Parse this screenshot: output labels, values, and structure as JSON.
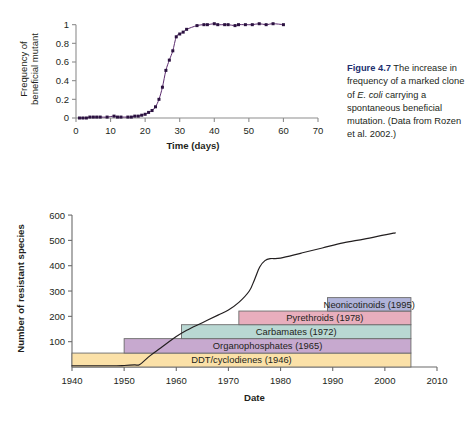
{
  "figure_caption": {
    "number": "Figure 4.7",
    "text_1": " The increase in frequency of a marked clone of ",
    "species": "E. coli",
    "text_2": " carrying a spontaneous beneficial mutation. (Data from Rozen et al. 2002.)"
  },
  "chart_data": [
    {
      "id": "top",
      "type": "line",
      "title": "",
      "xlabel": "Time (days)",
      "ylabel": "Frequency of beneficial mutant",
      "xlim": [
        0,
        70
      ],
      "ylim": [
        0,
        1.05
      ],
      "xticks": [
        0,
        10,
        20,
        30,
        40,
        50,
        60,
        70
      ],
      "xticklabels": [
        "0",
        "10",
        "20",
        "30",
        "40",
        "50",
        "60",
        "70"
      ],
      "yticks": [
        0,
        0.2,
        0.4,
        0.6,
        0.8,
        1
      ],
      "yticklabels": [
        "0",
        "0.2",
        "0.4",
        "0.6",
        "0.8",
        "1"
      ],
      "grid": false,
      "legend": "none",
      "marker": "filled-square",
      "color": "#5b2a6e",
      "series": [
        {
          "name": "Frequency of beneficial mutant",
          "x": [
            1,
            2,
            3,
            4,
            5,
            6,
            7,
            9,
            11,
            12,
            13,
            15,
            16,
            17,
            18,
            19,
            20,
            21,
            22,
            23,
            24,
            25,
            26,
            27,
            28,
            29,
            30,
            31,
            32,
            35,
            37,
            38,
            40,
            41,
            43,
            44,
            46,
            47,
            49,
            51,
            53,
            55,
            57,
            60
          ],
          "y": [
            0.0,
            0.0,
            0.0,
            0.01,
            0.01,
            0.01,
            0.01,
            0.01,
            0.02,
            0.01,
            0.01,
            0.01,
            0.01,
            0.02,
            0.02,
            0.03,
            0.04,
            0.06,
            0.08,
            0.12,
            0.2,
            0.33,
            0.51,
            0.62,
            0.72,
            0.87,
            0.9,
            0.92,
            0.95,
            0.99,
            1.0,
            1.0,
            1.01,
            1.0,
            1.0,
            1.0,
            0.99,
            1.0,
            1.0,
            1.0,
            1.01,
            1.0,
            1.01,
            1.0
          ]
        }
      ]
    },
    {
      "id": "bottom",
      "type": "line",
      "title": "",
      "xlabel": "Date",
      "ylabel": "Number of resistant species",
      "xlim": [
        1940,
        2010
      ],
      "ylim": [
        0,
        620
      ],
      "xticks": [
        1940,
        1950,
        1960,
        1970,
        1980,
        1990,
        2000,
        2010
      ],
      "xticklabels": [
        "1940",
        "1950",
        "1960",
        "1970",
        "1980",
        "1990",
        "2000",
        "2010"
      ],
      "yticks": [
        100,
        200,
        300,
        400,
        500,
        600
      ],
      "yticklabels": [
        "100",
        "200",
        "300",
        "400",
        "500",
        "600"
      ],
      "grid": false,
      "legend": "none",
      "color": "#231f20",
      "series": [
        {
          "name": "Number of resistant species",
          "x": [
            1940,
            1948,
            1950,
            1952,
            1953,
            1955,
            1957,
            1960,
            1962,
            1965,
            1968,
            1970,
            1972,
            1974,
            1975,
            1976,
            1977,
            1978,
            1980,
            1984,
            1988,
            1992,
            1996,
            2000,
            2002
          ],
          "y": [
            5,
            5,
            6,
            8,
            10,
            45,
            75,
            120,
            145,
            175,
            205,
            225,
            255,
            300,
            345,
            395,
            420,
            428,
            430,
            450,
            470,
            490,
            505,
            522,
            530
          ]
        }
      ],
      "bands": [
        {
          "label": "DDT/cyclodienes (1946)",
          "start": 1940,
          "end": 2005,
          "y0": 0,
          "y1": 55,
          "fill": "#fbe1a8",
          "stroke": "#6b6b6b",
          "label_align": "center"
        },
        {
          "label": "Organophosphates (1965)",
          "start": 1950,
          "end": 2005,
          "y0": 55,
          "y1": 112,
          "fill": "#c7a9cf",
          "stroke": "#6b6b6b",
          "label_align": "center"
        },
        {
          "label": "Carbamates (1972)",
          "start": 1961,
          "end": 2005,
          "y0": 112,
          "y1": 167,
          "fill": "#b9d8d3",
          "stroke": "#6b6b6b",
          "label_align": "center"
        },
        {
          "label": "Pyrethroids (1978)",
          "start": 1972,
          "end": 2005,
          "y0": 167,
          "y1": 221,
          "fill": "#e8aebd",
          "stroke": "#6b6b6b",
          "label_align": "center"
        },
        {
          "label": "Neonicotinoids (1995)",
          "start": 1989,
          "end": 2005,
          "y0": 221,
          "y1": 274,
          "fill": "#b0b3d9",
          "stroke": "#6b6b6b",
          "label_align": "center"
        }
      ]
    }
  ]
}
